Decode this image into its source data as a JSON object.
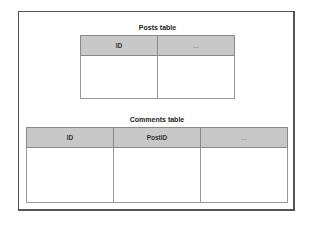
{
  "posts_table": {
    "title": "Posts table",
    "columns": [
      "ID",
      "..."
    ]
  },
  "comments_table": {
    "title": "Comments table",
    "columns": [
      "ID",
      "PostID",
      "..."
    ]
  }
}
